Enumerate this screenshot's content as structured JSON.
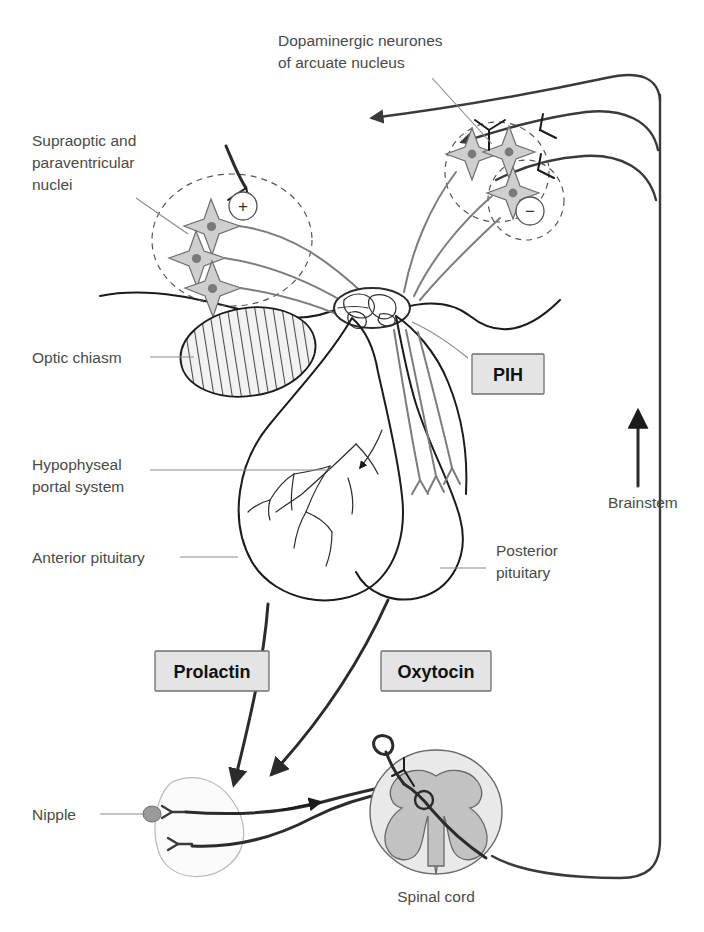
{
  "figure": {
    "background_color": "#ffffff"
  },
  "labels": {
    "dopaminergic": "Dopaminergic neurones\nof arcuate nucleus",
    "dopaminergic_line1": "Dopaminergic neurones",
    "dopaminergic_line2": "of arcuate nucleus",
    "supraoptic_line1": "Supraoptic and",
    "supraoptic_line2": "paraventricular",
    "supraoptic_line3": "nuclei",
    "optic_chiasm": "Optic chiasm",
    "hypophyseal_line1": "Hypophyseal",
    "hypophyseal_line2": "portal system",
    "anterior_pituitary": "Anterior pituitary",
    "posterior_line1": "Posterior",
    "posterior_line2": "pituitary",
    "brainstem": "Brainstem",
    "nipple": "Nipple",
    "spinal_cord": "Spinal cord"
  },
  "boxes": [
    {
      "id": "pih",
      "label": "PIH",
      "fill": "#e4e4e4",
      "border": "#6f6f6f"
    },
    {
      "id": "prolactin",
      "label": "Prolactin",
      "fill": "#e4e4e4",
      "border": "#6f6f6f"
    },
    {
      "id": "oxytocin",
      "label": "Oxytocin",
      "fill": "#e4e4e4",
      "border": "#6f6f6f"
    }
  ],
  "signs": [
    {
      "id": "excitatory",
      "symbol": "+",
      "meaning": "excitatory"
    },
    {
      "id": "inhibitory",
      "symbol": "−",
      "meaning": "inhibitory"
    }
  ],
  "colors": {
    "outline_dark": "#1b1b1b",
    "outline_mid": "#4d4d4d",
    "neuron_fill": "#cfcfcf",
    "neuron_nucleus": "#7a7a7a",
    "gray_matter": "#c2c2c2",
    "cord_fill": "#e9e9e9",
    "leader_line": "#8a8a8a",
    "text": "#4a4a4a"
  }
}
